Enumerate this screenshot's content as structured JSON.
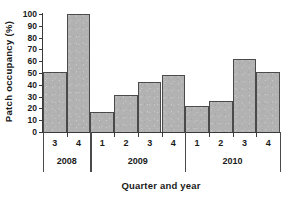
{
  "chart_data": {
    "type": "bar",
    "title": "",
    "xlabel": "Quarter and year",
    "ylabel": "Patch occupancy (%)",
    "ylim": [
      0,
      100
    ],
    "ytick_step": 10,
    "ytick_labels": [
      "100",
      "90",
      "80",
      "70",
      "60",
      "50",
      "40",
      "30",
      "20",
      "10",
      "0"
    ],
    "grid": false,
    "legend": null,
    "bar_color": "#b2b2b2",
    "bar_edge_color": "#4a4a4a",
    "axis_color": "#3a3a3a",
    "categories": [
      "3",
      "4",
      "1",
      "2",
      "3",
      "4",
      "1",
      "2",
      "3",
      "4"
    ],
    "values": [
      51,
      100,
      17,
      31,
      42,
      48,
      22,
      26,
      62,
      51
    ],
    "groups": [
      {
        "label": "2008",
        "quarters": [
          "3",
          "4"
        ],
        "values": [
          51,
          100
        ]
      },
      {
        "label": "2009",
        "quarters": [
          "1",
          "2",
          "3",
          "4"
        ],
        "values": [
          17,
          31,
          42,
          48
        ]
      },
      {
        "label": "2010",
        "quarters": [
          "1",
          "2",
          "3",
          "4"
        ],
        "values": [
          22,
          26,
          62,
          51
        ]
      }
    ],
    "points": [
      {
        "quarter": "3",
        "year": "2008",
        "value": 51
      },
      {
        "quarter": "4",
        "year": "2008",
        "value": 100
      },
      {
        "quarter": "1",
        "year": "2009",
        "value": 17
      },
      {
        "quarter": "2",
        "year": "2009",
        "value": 31
      },
      {
        "quarter": "3",
        "year": "2009",
        "value": 42
      },
      {
        "quarter": "4",
        "year": "2009",
        "value": 48
      },
      {
        "quarter": "1",
        "year": "2010",
        "value": 22
      },
      {
        "quarter": "2",
        "year": "2010",
        "value": 26
      },
      {
        "quarter": "3",
        "year": "2010",
        "value": 62
      },
      {
        "quarter": "4",
        "year": "2010",
        "value": 51
      }
    ]
  }
}
